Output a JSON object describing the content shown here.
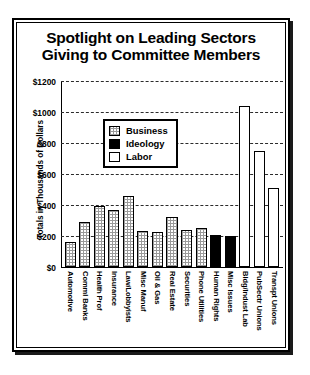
{
  "chart_data": {
    "type": "bar",
    "title": "Spotlight on Leading Sectors Giving to Committee Members",
    "title_lines": [
      "Spotlight on Leading Sectors",
      "Giving to Committee Members"
    ],
    "xlabel": "",
    "ylabel": "Totals in Thousands of Dollars",
    "ylim": [
      0,
      1200
    ],
    "ytick_labels": [
      "$1200",
      "$1000",
      "$800",
      "$600",
      "$400",
      "$200",
      "$0"
    ],
    "ytick_values": [
      1200,
      1000,
      800,
      600,
      400,
      200,
      0
    ],
    "grid": true,
    "legend_position": "upper-center",
    "categories": [
      "Automotive",
      "Comml Banks",
      "Health Prof",
      "Insurance",
      "Law/Lobbyists",
      "Misc Manuf",
      "Oil & Gas",
      "Real Estate",
      "Securities",
      "Phone Utilities",
      "Human Rights",
      "Misc Issues",
      "Bldg/Indust Lab",
      "PubSectr Unions",
      "Transpt Unions"
    ],
    "values": [
      160,
      290,
      395,
      365,
      460,
      235,
      225,
      325,
      240,
      250,
      205,
      200,
      1040,
      750,
      510
    ],
    "groups": [
      "Business",
      "Business",
      "Business",
      "Business",
      "Business",
      "Business",
      "Business",
      "Business",
      "Business",
      "Business",
      "Ideology",
      "Ideology",
      "Labor",
      "Labor",
      "Labor"
    ],
    "legend": [
      {
        "label": "Business",
        "pattern": "light-checker"
      },
      {
        "label": "Ideology",
        "pattern": "solid-black"
      },
      {
        "label": "Labor",
        "pattern": "dark-checker"
      }
    ],
    "colors": {
      "business": "#9a9a9a",
      "ideology": "#000000",
      "labor": "#4a4a4a",
      "axis": "#000000",
      "background": "#ffffff"
    }
  }
}
